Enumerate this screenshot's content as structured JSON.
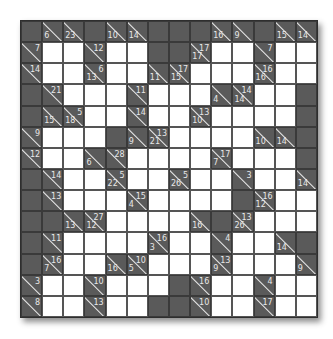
{
  "puzzle": {
    "type": "kakuro",
    "rows": 14,
    "cols": 14,
    "colors": {
      "dark": "#5a5a5a",
      "white": "#ffffff",
      "clue_text": "#e8e8e8",
      "grid_line": "#3a3a3a"
    },
    "grid": [
      [
        "D",
        {
          "d": 6
        },
        {
          "d": 23
        },
        "D",
        {
          "d": 10
        },
        {
          "d": 14
        },
        "D",
        "D",
        "D",
        {
          "d": 16
        },
        {
          "d": 9
        },
        "D",
        {
          "d": 15
        },
        {
          "d": 14
        }
      ],
      [
        {
          "a": 7
        },
        "W",
        "W",
        {
          "a": 12
        },
        "W",
        "W",
        "D",
        "D",
        {
          "d": 17,
          "a": 17
        },
        "W",
        "W",
        {
          "a": 7
        },
        "W",
        "W"
      ],
      [
        {
          "a": 14
        },
        "W",
        "W",
        {
          "d": 13,
          "a": 6
        },
        "W",
        "W",
        {
          "d": 11
        },
        {
          "d": 15,
          "a": 17
        },
        "W",
        "W",
        "W",
        {
          "d": 16,
          "a": 16
        },
        "W",
        "W"
      ],
      [
        "D",
        {
          "a": 21
        },
        "W",
        "W",
        "W",
        {
          "a": 11
        },
        "W",
        "W",
        "W",
        {
          "d": 4
        },
        {
          "d": 14,
          "a": 14
        },
        "W",
        "W",
        "D"
      ],
      [
        "D",
        {
          "d": 15
        },
        {
          "d": 18,
          "a": 5
        },
        "W",
        "W",
        {
          "a": 14
        },
        "W",
        "W",
        {
          "d": 10,
          "a": 13
        },
        "W",
        "W",
        "W",
        "W",
        "D"
      ],
      [
        {
          "a": 9
        },
        "W",
        "W",
        "W",
        "D",
        {
          "d": 9
        },
        {
          "d": 21,
          "a": 13
        },
        "W",
        "W",
        "W",
        "W",
        {
          "d": 10
        },
        {
          "d": 14
        },
        "D"
      ],
      [
        {
          "a": 12
        },
        "W",
        "W",
        {
          "d": 6
        },
        {
          "a": 28
        },
        "W",
        "W",
        "W",
        "W",
        {
          "d": 7,
          "a": 17
        },
        "W",
        "W",
        "W",
        "D"
      ],
      [
        "D",
        {
          "a": 14
        },
        "W",
        "W",
        {
          "d": 22,
          "a": 5
        },
        "W",
        "W",
        {
          "d": 26,
          "a": 5
        },
        "W",
        "W",
        {
          "a": 3
        },
        "W",
        "W",
        {
          "d": 14
        }
      ],
      [
        "D",
        {
          "a": 13
        },
        "W",
        "W",
        "W",
        {
          "d": 4,
          "a": 15
        },
        "W",
        "W",
        "W",
        "W",
        "D",
        {
          "d": 12,
          "a": 16
        },
        "W",
        "W"
      ],
      [
        "D",
        "D",
        {
          "d": 13
        },
        {
          "d": 12,
          "a": 27
        },
        "W",
        "W",
        "W",
        "W",
        {
          "d": 16
        },
        "D",
        {
          "d": 26,
          "a": 13
        },
        "W",
        "W",
        "W"
      ],
      [
        "D",
        {
          "a": 11
        },
        "W",
        "W",
        "W",
        "W",
        {
          "d": 3,
          "a": 16
        },
        "W",
        "W",
        {
          "a": 4
        },
        "W",
        "W",
        {
          "d": 14
        },
        "D"
      ],
      [
        "D",
        {
          "d": 7,
          "a": 16
        },
        "W",
        "W",
        {
          "d": 16
        },
        {
          "d": 5,
          "a": 10
        },
        "W",
        "W",
        "W",
        {
          "d": 9,
          "a": 13
        },
        "W",
        "W",
        "W",
        {
          "d": 9
        }
      ],
      [
        {
          "a": 3
        },
        "W",
        "W",
        {
          "a": 10
        },
        "W",
        "W",
        "W",
        "D",
        {
          "a": 16
        },
        "W",
        "W",
        {
          "a": 4
        },
        "W",
        "W"
      ],
      [
        {
          "a": 8
        },
        "W",
        "W",
        {
          "a": 13
        },
        "W",
        "W",
        "D",
        "D",
        {
          "a": 10
        },
        "W",
        "W",
        {
          "a": 17
        },
        "W",
        "W"
      ]
    ]
  }
}
